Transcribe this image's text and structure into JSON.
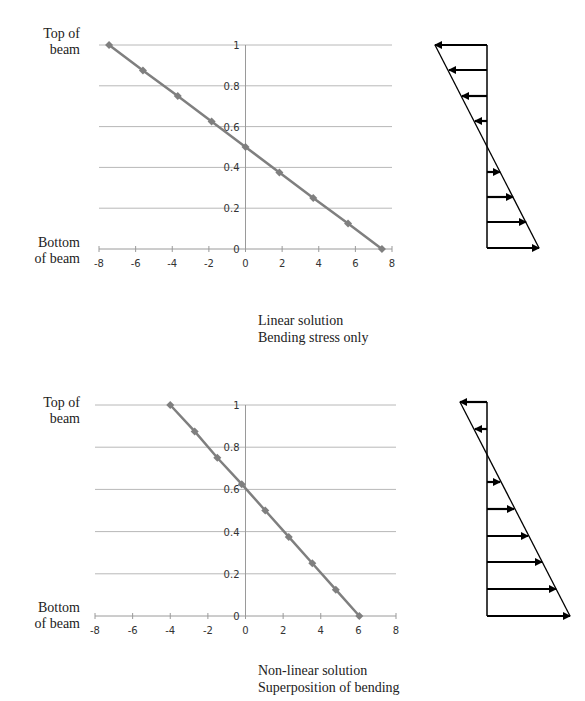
{
  "page": {
    "top_cutoff_text": "· · · · · · · · · · · · · · ·"
  },
  "charts": [
    {
      "top_label": "Top of beam",
      "top_label_lines": [
        "Top of",
        "beam"
      ],
      "bottom_label_lines": [
        "Bottom",
        "of beam"
      ],
      "caption_lines": [
        "Linear solution",
        "Bending stress only"
      ]
    },
    {
      "top_label_lines": [
        "Top of",
        "beam"
      ],
      "bottom_label_lines": [
        "Bottom",
        "of beam"
      ],
      "caption_lines": [
        "Non-linear solution",
        "Superposition of bending"
      ]
    }
  ],
  "chart_data": [
    {
      "type": "line",
      "title": "Linear solution — Bending stress only",
      "xlabel": "",
      "ylabel": "",
      "xlim": [
        -8,
        8
      ],
      "ylim": [
        0,
        1
      ],
      "x_ticks": [
        "-8",
        "-6",
        "-4",
        "-2",
        "0",
        "2",
        "4",
        "6",
        "8"
      ],
      "y_ticks": [
        "0",
        "0.2",
        "0.4",
        "0.6",
        "0.8",
        "1"
      ],
      "grid": "horizontal",
      "marker": "diamond",
      "line_color": "#7f7f7f",
      "annotations": [
        "Top of beam",
        "Bottom of beam"
      ],
      "series": [
        {
          "name": "Stress",
          "x": [
            -7.45,
            -5.6,
            -3.7,
            -1.85,
            0,
            1.85,
            3.7,
            5.6,
            7.45
          ],
          "y": [
            1,
            0.875,
            0.75,
            0.625,
            0.5,
            0.375,
            0.25,
            0.125,
            0
          ]
        }
      ],
      "arrow_diagram": {
        "description": "Linear bending stress distribution",
        "arrows": [
          -1,
          -0.75,
          -0.5,
          -0.25,
          0.25,
          0.5,
          0.75,
          1
        ]
      }
    },
    {
      "type": "line",
      "title": "Non-linear solution — Superposition of bending",
      "xlabel": "",
      "ylabel": "",
      "xlim": [
        -8,
        8
      ],
      "ylim": [
        0,
        1
      ],
      "x_ticks": [
        "-8",
        "-6",
        "-4",
        "-2",
        "0",
        "2",
        "4",
        "6",
        "8"
      ],
      "y_ticks": [
        "0",
        "0.2",
        "0.4",
        "0.6",
        "0.8",
        "1"
      ],
      "grid": "horizontal",
      "marker": "diamond",
      "line_color": "#7f7f7f",
      "annotations": [
        "Top of beam",
        "Bottom of beam"
      ],
      "series": [
        {
          "name": "Stress",
          "x": [
            -4.0,
            -2.7,
            -1.5,
            -0.2,
            1.05,
            2.3,
            3.55,
            4.8,
            6.05
          ],
          "y": [
            1,
            0.875,
            0.75,
            0.625,
            0.5,
            0.375,
            0.25,
            0.125,
            0
          ]
        }
      ],
      "arrow_diagram": {
        "description": "Shifted stress distribution (superposition)",
        "arrows": [
          -0.5,
          -0.25,
          0.2,
          0.35,
          0.5,
          0.65,
          0.8,
          1
        ]
      }
    }
  ]
}
